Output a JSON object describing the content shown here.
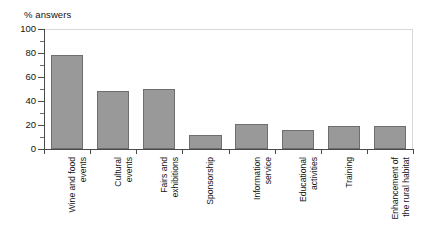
{
  "chart_data": {
    "type": "bar",
    "title": "",
    "ylabel": "% answers",
    "xlabel": "",
    "ylim": [
      0,
      100
    ],
    "yticks": [
      0,
      20,
      40,
      60,
      80,
      100
    ],
    "ytick_labels": [
      "0",
      "20",
      "40",
      "60",
      "80",
      "100"
    ],
    "minor_tick_step": 10,
    "grid": false,
    "legend": "none",
    "bar_color": "#999999",
    "bar_edge_color": "#6e6e6e",
    "axis_color": "#4a4a4a",
    "frame_color": "#d8d8d8",
    "categories": [
      "Wine and food\nevents",
      "Cultural\nevents",
      "Fairs and\nexhibitions",
      "Sponsorship",
      "Information\nservice",
      "Educational\nactivities",
      "Training",
      "Enhancement of\nthe rural habitat"
    ],
    "values": [
      78,
      48,
      50,
      12,
      21,
      16,
      19,
      19
    ]
  },
  "axis": {
    "y_title": "% answers"
  }
}
